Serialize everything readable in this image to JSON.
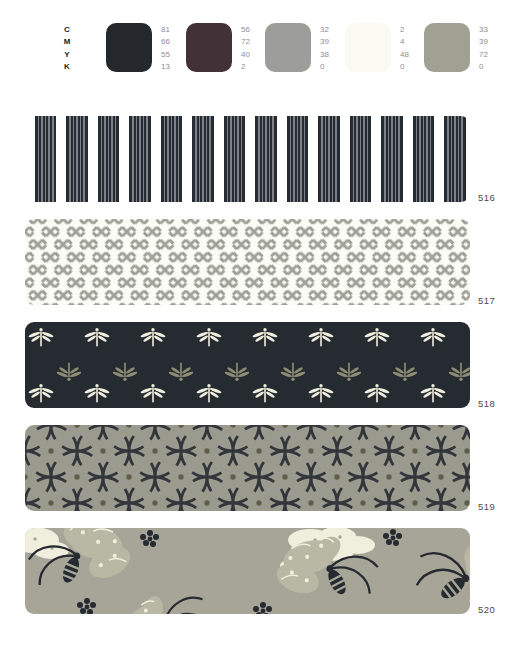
{
  "header": {
    "channel_labels": [
      "C",
      "M",
      "Y",
      "K"
    ],
    "swatches": [
      {
        "name": "dark-navy",
        "color": "#24272c",
        "values": [
          "81",
          "66",
          "55",
          "13"
        ]
      },
      {
        "name": "dark-maroon",
        "color": "#433138",
        "values": [
          "56",
          "72",
          "40",
          "2"
        ]
      },
      {
        "name": "warm-gray",
        "color": "#9d9e99",
        "values": [
          "32",
          "39",
          "38",
          "0"
        ]
      },
      {
        "name": "pale-cream",
        "color": "#fbfaf2",
        "values": [
          "2",
          "4",
          "48",
          "0"
        ]
      },
      {
        "name": "olive-gray",
        "color": "#a0a093",
        "values": [
          "33",
          "39",
          "72",
          "0"
        ]
      }
    ]
  },
  "strips": [
    {
      "label": "516",
      "pattern": "vertical-stripe-bands"
    },
    {
      "label": "517",
      "pattern": "sayagata-key-fret"
    },
    {
      "label": "518",
      "pattern": "dragonfly-rows"
    },
    {
      "label": "519",
      "pattern": "shippo-interlocking-circles"
    },
    {
      "label": "520",
      "pattern": "butterflies-and-clouds"
    }
  ],
  "colors": {
    "navy": "#262a31",
    "navyLight": "#7c818a",
    "paper": "#ffffff",
    "paper517": "#fcfcf6",
    "gray517": "#9fa098",
    "cream": "#f0eedd",
    "oliveDfly": "#8e8c72",
    "sage519": "#9a9b8e",
    "navy519": "#32363b",
    "dot519": "#5f5e4a",
    "tan520": "#a6a597",
    "wing520": "#b9b8a4"
  }
}
